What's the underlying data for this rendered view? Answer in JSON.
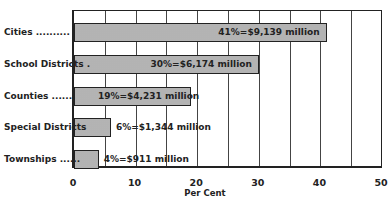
{
  "chart_data": {
    "type": "bar",
    "orientation": "horizontal",
    "title": "",
    "xlabel": "Per Cent",
    "ylabel": "",
    "xlim": [
      0,
      50
    ],
    "xticks": [
      "0",
      "10",
      "20",
      "30",
      "40",
      "50"
    ],
    "grid": "vertical lines every 5%",
    "categories": [
      "Cities",
      "School Districts",
      "Counties",
      "Special Districts",
      "Townships"
    ],
    "values": [
      41,
      30,
      19,
      6,
      4
    ],
    "amounts_million_usd": [
      9139,
      6174,
      4231,
      1344,
      911
    ],
    "data_labels": [
      "41%=$9,139 million",
      "30%=$6,174 million",
      "19%=$4,231 million",
      "6%=$1,344 million",
      "4%=$911 million"
    ],
    "category_labels": [
      "Cities ..........",
      "School Districts .",
      "Counties .......",
      "Special Districts",
      "Townships ......"
    ]
  }
}
